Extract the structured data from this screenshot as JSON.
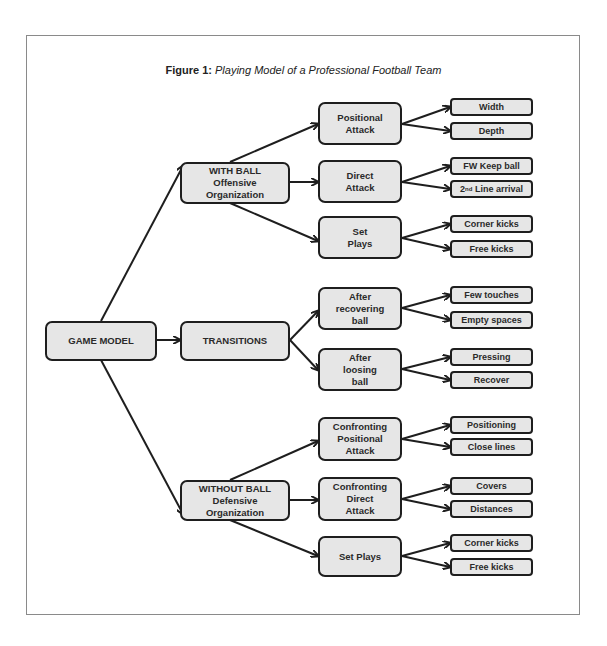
{
  "figure": {
    "label": "Figure 1:",
    "caption": "Playing Model of a Professional Football Team"
  },
  "tree": {
    "root": "GAME MODEL",
    "phases": [
      {
        "label": "WITH BALL\nOffensive\nOrganization",
        "sub": [
          {
            "label": "Positional\nAttack",
            "leaves": [
              "Width",
              "Depth"
            ]
          },
          {
            "label": "Direct\nAttack",
            "leaves": [
              "FW Keep ball",
              "2nd Line arrival"
            ]
          },
          {
            "label": "Set\nPlays",
            "leaves": [
              "Corner kicks",
              "Free kicks"
            ]
          }
        ]
      },
      {
        "label": "TRANSITIONS",
        "sub": [
          {
            "label": "After\nrecovering\nball",
            "leaves": [
              "Few touches",
              "Empty spaces"
            ]
          },
          {
            "label": "After\nloosing\nball",
            "leaves": [
              "Pressing",
              "Recover"
            ]
          }
        ]
      },
      {
        "label": "WITHOUT BALL\nDefensive\nOrganization",
        "sub": [
          {
            "label": "Confronting\nPositional\nAttack",
            "leaves": [
              "Positioning",
              "Close lines"
            ]
          },
          {
            "label": "Confronting\nDirect\nAttack",
            "leaves": [
              "Covers",
              "Distances"
            ]
          },
          {
            "label": "Set Plays",
            "leaves": [
              "Corner kicks",
              "Free kicks"
            ]
          }
        ]
      }
    ]
  },
  "leaf_2nd_line": {
    "prefix": "2",
    "sup": "nd",
    "rest": " Line arrival"
  },
  "colors": {
    "box_fill": "#e6e6e6",
    "box_border": "#1e1e1e",
    "frame": "#8a8a8a",
    "arrow": "#1e1e1e"
  }
}
